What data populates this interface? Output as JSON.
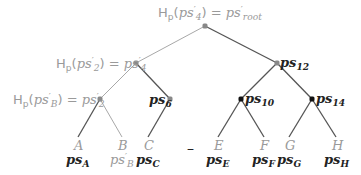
{
  "colors": {
    "gray_edge": "#a8a8a8",
    "dark_edge": "#555555",
    "gray_text": "#9a9a9a",
    "dark_text": "#222222",
    "gray_node": "#888888",
    "dark_node": "#111111"
  },
  "nodes": {
    "root": {
      "x": 205,
      "y": 26,
      "label": "Hp(ps'4) = ps'root",
      "label_parts": {
        "h": "H",
        "h_sub": "p",
        "arg": "ps",
        "arg_prime": "′",
        "arg_sub": "4",
        "eq": "=",
        "rhs": "ps",
        "rhs_prime": "′",
        "rhs_sub": "root"
      }
    },
    "ps4p": {
      "x": 136,
      "y": 63,
      "label": "Hp(ps'2) = ps'4",
      "label_parts": {
        "h": "H",
        "h_sub": "p",
        "arg": "ps",
        "arg_prime": "′",
        "arg_sub": "2",
        "eq": "=",
        "rhs": "ps",
        "rhs_prime": "′",
        "rhs_sub": "4"
      }
    },
    "ps12": {
      "x": 277,
      "y": 63,
      "label": "ps12",
      "label_parts": {
        "main": "ps",
        "sub": "12"
      }
    },
    "ps2p": {
      "x": 100,
      "y": 99,
      "label": "Hp(ps'B) = ps'2",
      "label_parts": {
        "h": "H",
        "h_sub": "p",
        "arg": "ps",
        "arg_prime": "′",
        "arg_sub": "B",
        "eq": "=",
        "rhs": "ps",
        "rhs_prime": "′",
        "rhs_sub": "2"
      }
    },
    "ps6": {
      "x": 170,
      "y": 99,
      "label": "ps6",
      "label_parts": {
        "main": "ps",
        "sub": "6"
      }
    },
    "ps10": {
      "x": 241,
      "y": 99,
      "label": "ps10",
      "label_parts": {
        "main": "ps",
        "sub": "10"
      }
    },
    "ps14": {
      "x": 312,
      "y": 99,
      "label": "ps14",
      "label_parts": {
        "main": "ps",
        "sub": "14"
      }
    }
  },
  "leaves": [
    {
      "letter": "A",
      "x": 78,
      "hash_main": "ps",
      "hash_sub": "A",
      "hash_prime": "",
      "letter_color": "gray",
      "hash_color": "dark"
    },
    {
      "letter": "B",
      "x": 122,
      "hash_main": "ps",
      "hash_sub": "B",
      "hash_prime": "′",
      "letter_color": "gray",
      "hash_color": "gray"
    },
    {
      "letter": "C",
      "x": 148,
      "hash_main": "ps",
      "hash_sub": "C",
      "hash_prime": "",
      "letter_color": "gray",
      "hash_color": "dark"
    },
    {
      "letter": "E",
      "x": 218,
      "hash_main": "ps",
      "hash_sub": "E",
      "hash_prime": "",
      "letter_color": "gray",
      "hash_color": "dark"
    },
    {
      "letter": "F",
      "x": 264,
      "hash_main": "ps",
      "hash_sub": "F",
      "hash_prime": "",
      "letter_color": "gray",
      "hash_color": "dark"
    },
    {
      "letter": "G",
      "x": 289,
      "hash_main": "ps",
      "hash_sub": "G",
      "hash_prime": "",
      "letter_color": "gray",
      "hash_color": "dark"
    },
    {
      "letter": "H",
      "x": 336,
      "hash_main": "ps",
      "hash_sub": "H",
      "hash_prime": "",
      "letter_color": "gray",
      "hash_color": "dark"
    }
  ],
  "deleted_marker": {
    "x": 191,
    "symbol": "–"
  },
  "edges": [
    {
      "from": "root",
      "to": "ps4p",
      "style": "gray"
    },
    {
      "from": "root",
      "to": "ps12",
      "style": "dark"
    },
    {
      "from": "ps4p",
      "to": "ps2p",
      "style": "gray"
    },
    {
      "from": "ps4p",
      "to": "ps6",
      "style": "dark"
    },
    {
      "from": "ps12",
      "to": "ps10",
      "style": "dark"
    },
    {
      "from": "ps12",
      "to": "ps14",
      "style": "dark"
    },
    {
      "from": "ps2p",
      "to": "leaf:A",
      "style": "dark"
    },
    {
      "from": "ps2p",
      "to": "leaf:B",
      "style": "gray"
    },
    {
      "from": "ps6",
      "to": "leaf:C",
      "style": "dark"
    },
    {
      "from": "ps10",
      "to": "leaf:E",
      "style": "dark"
    },
    {
      "from": "ps10",
      "to": "leaf:F",
      "style": "dark"
    },
    {
      "from": "ps14",
      "to": "leaf:G",
      "style": "dark"
    },
    {
      "from": "ps14",
      "to": "leaf:H",
      "style": "dark"
    }
  ]
}
